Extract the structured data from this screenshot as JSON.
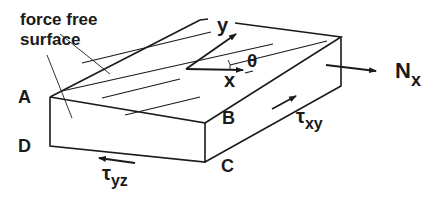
{
  "diagram": {
    "labels": {
      "force_free": "force free",
      "surface": "surface",
      "corner_a": "A",
      "corner_b": "B",
      "corner_c": "C",
      "corner_d": "D",
      "axis_x": "x",
      "axis_y": "y",
      "angle": "θ",
      "normal_force": "N",
      "normal_force_sub": "x",
      "shear_xy": "τ",
      "shear_xy_sub": "xy",
      "shear_yz": "τ",
      "shear_yz_sub": "yz"
    },
    "colors": {
      "line": "#1a1a1a",
      "background": "#ffffff"
    }
  }
}
